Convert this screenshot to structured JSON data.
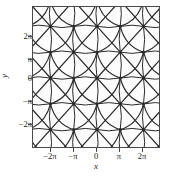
{
  "chart_data": {
    "type": "line",
    "title": "",
    "xlabel": "x",
    "ylabel": "y",
    "xlim": [
      -8.64,
      8.64
    ],
    "ylim": [
      -8.64,
      8.64
    ],
    "grid": false,
    "legend": null,
    "xticks": [
      -6.2832,
      -3.1416,
      0,
      3.1416,
      6.2832
    ],
    "xticklabels": [
      "−2π",
      "−π",
      "0",
      "π",
      "2π"
    ],
    "yticks": [
      -6.2832,
      -3.1416,
      0,
      3.1416,
      6.2832
    ],
    "yticklabels": [
      "−2π",
      "−π",
      "0",
      "π",
      "2π"
    ],
    "node_lattice_period": 3.1416,
    "nodes": [
      {
        "x": -6.2832,
        "y": 6.2832
      },
      {
        "x": -3.1416,
        "y": 6.2832
      },
      {
        "x": 0,
        "y": 6.2832
      },
      {
        "x": 3.1416,
        "y": 6.2832
      },
      {
        "x": 6.2832,
        "y": 6.2832
      },
      {
        "x": -6.2832,
        "y": 3.1416
      },
      {
        "x": -3.1416,
        "y": 3.1416
      },
      {
        "x": 0,
        "y": 3.1416
      },
      {
        "x": 3.1416,
        "y": 3.1416
      },
      {
        "x": 6.2832,
        "y": 3.1416
      },
      {
        "x": -6.2832,
        "y": 0
      },
      {
        "x": -3.1416,
        "y": 0
      },
      {
        "x": 0,
        "y": 0
      },
      {
        "x": 3.1416,
        "y": 0
      },
      {
        "x": 6.2832,
        "y": 0
      },
      {
        "x": -6.2832,
        "y": -3.1416
      },
      {
        "x": -3.1416,
        "y": -3.1416
      },
      {
        "x": 0,
        "y": -3.1416
      },
      {
        "x": 3.1416,
        "y": -3.1416
      },
      {
        "x": 6.2832,
        "y": -3.1416
      },
      {
        "x": -6.2832,
        "y": -6.2832
      },
      {
        "x": -3.1416,
        "y": -6.2832
      },
      {
        "x": 0,
        "y": -6.2832
      },
      {
        "x": 3.1416,
        "y": -6.2832
      },
      {
        "x": 6.2832,
        "y": -6.2832
      }
    ],
    "line_color": "#2b2b2b",
    "frame_color": "#4a4a4a",
    "background_color": "#fdfdfd"
  },
  "axes": {
    "xlabel": "x",
    "ylabel": "y",
    "xticklabels": [
      "−2π",
      "−π",
      "0",
      "π",
      "2π"
    ],
    "yticklabels": [
      "2π",
      "π",
      "0",
      "−π",
      "−2π"
    ]
  }
}
